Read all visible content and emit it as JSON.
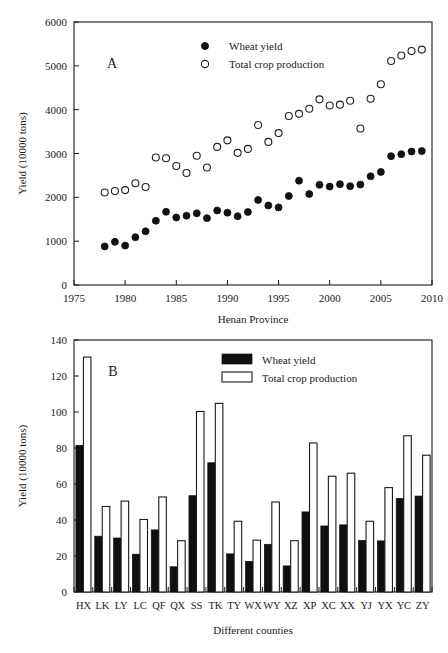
{
  "figure": {
    "panel_a_letter": "A",
    "panel_b_letter": "B"
  },
  "chart_data": [
    {
      "id": "panel-a",
      "type": "scatter",
      "title": "",
      "panel_label": "A",
      "xlabel": "Henan Province",
      "ylabel": "Yield (10000 tons)",
      "xlim": [
        1975,
        2010
      ],
      "ylim": [
        0,
        6000
      ],
      "xticks": [
        1975,
        1980,
        1985,
        1990,
        1995,
        2000,
        2005,
        2010
      ],
      "xtick_labels": [
        "1975",
        "1980",
        "1985",
        "1990",
        "1995",
        "2000",
        "2005",
        "2010"
      ],
      "yticks": [
        0,
        1000,
        2000,
        3000,
        4000,
        5000,
        6000
      ],
      "ytick_labels": [
        "0",
        "1000",
        "2000",
        "3000",
        "4000",
        "5000",
        "6000"
      ],
      "grid": false,
      "legend_position": "top-center",
      "x": [
        1978,
        1979,
        1980,
        1981,
        1982,
        1983,
        1984,
        1985,
        1986,
        1987,
        1988,
        1989,
        1990,
        1991,
        1992,
        1993,
        1994,
        1995,
        1996,
        1997,
        1998,
        1999,
        2000,
        2001,
        2002,
        2003,
        2004,
        2005,
        2006,
        2007,
        2008,
        2009
      ],
      "series": [
        {
          "name": "Wheat yield",
          "marker": "filled-circle",
          "values": [
            880,
            985,
            900,
            1090,
            1225,
            1465,
            1670,
            1540,
            1580,
            1635,
            1525,
            1700,
            1650,
            1570,
            1665,
            1940,
            1815,
            1770,
            2030,
            2380,
            2075,
            2285,
            2245,
            2300,
            2255,
            2290,
            2480,
            2580,
            2940,
            2985,
            3045,
            3055
          ]
        },
        {
          "name": "Total crop production",
          "marker": "open-circle",
          "values": [
            2110,
            2145,
            2165,
            2320,
            2235,
            2910,
            2890,
            2715,
            2555,
            2950,
            2680,
            3150,
            3300,
            3015,
            3105,
            3650,
            3265,
            3465,
            3855,
            3905,
            4020,
            4235,
            4095,
            4115,
            4205,
            3570,
            4250,
            4580,
            5110,
            5235,
            5340,
            5370
          ]
        }
      ]
    },
    {
      "id": "panel-b",
      "type": "bar",
      "title": "",
      "panel_label": "B",
      "xlabel": "Different counties",
      "ylabel": "Yield (10000 tons)",
      "ylim": [
        0,
        140
      ],
      "yticks": [
        0,
        20,
        40,
        60,
        80,
        100,
        120,
        140
      ],
      "ytick_labels": [
        "0",
        "20",
        "40",
        "60",
        "80",
        "100",
        "120",
        "140"
      ],
      "grid": false,
      "legend_position": "top-center",
      "categories": [
        "HX",
        "LK",
        "LY",
        "LC",
        "QF",
        "QX",
        "SS",
        "TK",
        "TY",
        "WX",
        "WY",
        "XZ",
        "XP",
        "XC",
        "XX",
        "YJ",
        "YX",
        "YC",
        "ZY"
      ],
      "series": [
        {
          "name": "Wheat yield",
          "style": "filled",
          "values": [
            81.5,
            31.0,
            30.0,
            21.0,
            34.5,
            14.0,
            53.5,
            71.8,
            21.2,
            17.0,
            26.5,
            14.5,
            44.5,
            36.7,
            37.3,
            28.7,
            28.4,
            52.0,
            53.3
          ]
        },
        {
          "name": "Total crop production",
          "style": "open",
          "values": [
            130.5,
            47.5,
            50.5,
            40.3,
            52.8,
            28.5,
            100.3,
            104.8,
            39.3,
            28.8,
            50.0,
            28.5,
            82.8,
            64.3,
            66.0,
            39.3,
            58.0,
            86.8,
            76.0
          ]
        }
      ]
    }
  ],
  "panel_a": {
    "ylabel": "Yield (10000 tons)",
    "xlabel": "Henan Province",
    "letter": "A",
    "legend": [
      {
        "label": "Wheat yield",
        "marker": "filled-circle"
      },
      {
        "label": "Total crop production",
        "marker": "open-circle"
      }
    ]
  },
  "panel_b": {
    "ylabel": "Yield (10000 tons)",
    "xlabel": "Different counties",
    "letter": "B",
    "legend": [
      {
        "label": "Wheat yield",
        "marker": "filled-square"
      },
      {
        "label": "Total crop production",
        "marker": "open-square"
      }
    ]
  },
  "colors": {
    "wheat_yield": "#101010",
    "total_crop_production": "#ffffff",
    "axis": "#1a1a1a",
    "background": "#ffffff"
  }
}
